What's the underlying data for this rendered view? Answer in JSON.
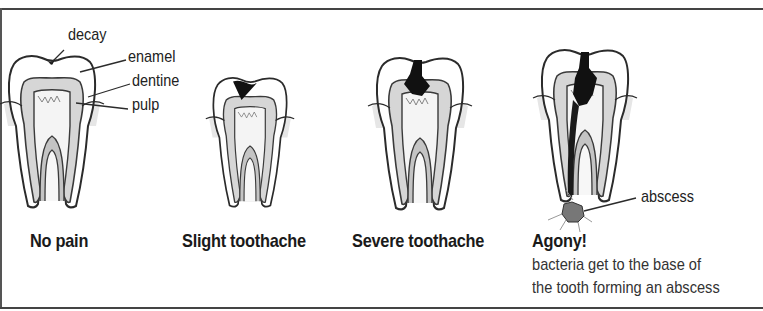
{
  "diagram": {
    "colors": {
      "outline": "#2b2b2b",
      "enamel": "#ffffff",
      "dentine": "#d6d6d6",
      "pulp": "#f2f2f2",
      "pulp_core": "#bdbdbd",
      "gum": "#e4e4e4",
      "decay": "#111111",
      "abscess": "#777777"
    },
    "anatomy_labels": {
      "decay": "decay",
      "enamel": "enamel",
      "dentine": "dentine",
      "pulp": "pulp"
    },
    "stages": [
      {
        "label": "No pain"
      },
      {
        "label": "Slight toothache"
      },
      {
        "label": "Severe toothache"
      },
      {
        "label": "Agony!",
        "description_line1": "bacteria get to the base of",
        "description_line2": "the tooth forming an abscess"
      }
    ],
    "abscess_label": "abscess"
  }
}
